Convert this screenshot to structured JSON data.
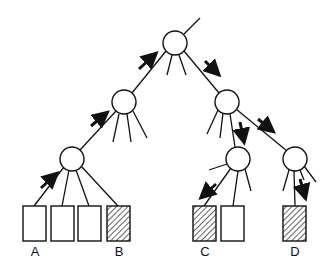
{
  "diagram": {
    "type": "tree-traversal",
    "nodes": [
      {
        "id": "root",
        "cx": 175,
        "cy": 43
      },
      {
        "id": "l1-left",
        "cx": 124,
        "cy": 102
      },
      {
        "id": "l1-right",
        "cx": 227,
        "cy": 102
      },
      {
        "id": "l2-left",
        "cx": 72,
        "cy": 159
      },
      {
        "id": "l2-mid",
        "cx": 238,
        "cy": 159
      },
      {
        "id": "l2-right",
        "cx": 295,
        "cy": 159
      }
    ],
    "leaves": [
      {
        "id": "A",
        "label": "A",
        "hatched": false
      },
      {
        "id": "leaf2",
        "label": "",
        "hatched": false
      },
      {
        "id": "leaf3",
        "label": "",
        "hatched": false
      },
      {
        "id": "B",
        "label": "B",
        "hatched": true
      },
      {
        "id": "C",
        "label": "C",
        "hatched": true
      },
      {
        "id": "leaf6",
        "label": "",
        "hatched": false
      },
      {
        "id": "D",
        "label": "D",
        "hatched": true
      }
    ],
    "labels": {
      "a": "A",
      "b": "B",
      "c": "C",
      "d": "D"
    },
    "colors": {
      "stroke": "#111111",
      "background": "#ffffff"
    }
  }
}
